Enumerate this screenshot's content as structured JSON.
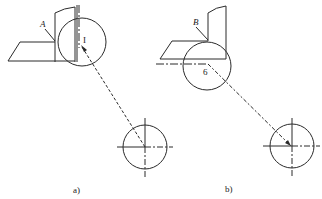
{
  "figure": {
    "panels": [
      {
        "id": "a",
        "caption": "a)",
        "tool_label": "A",
        "point_label": "I",
        "elements": [
          "cutting-tool",
          "tool-holder",
          "large-circle",
          "vertical-centerline",
          "dashed-leader",
          "small-circle-crosshair"
        ]
      },
      {
        "id": "b",
        "caption": "b)",
        "tool_label": "B",
        "point_label": "6",
        "elements": [
          "cutting-tool",
          "tool-holder",
          "large-circle",
          "horizontal-dashdot-line",
          "dashed-leader",
          "small-circle-crosshair"
        ]
      }
    ]
  },
  "colors": {
    "line": "#2a2a2a",
    "background": "#ffffff"
  }
}
